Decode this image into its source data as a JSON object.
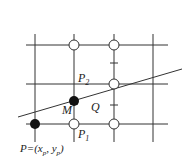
{
  "diagram": {
    "grid": {
      "vertical_x": [
        35,
        74,
        114,
        153
      ],
      "horizontal_y": [
        45,
        84,
        124
      ],
      "color": "#333333"
    },
    "line": {
      "x1": 18,
      "y1": 117,
      "x2": 182,
      "y2": 69
    },
    "points": {
      "P": {
        "label": "P=(x",
        "sub1": "p",
        "mid": ", y",
        "sub2": "p",
        "end": ")"
      },
      "P1": {
        "label": "P",
        "sub": "1"
      },
      "P2": {
        "label": "P",
        "sub": "2"
      },
      "M": {
        "label": "M"
      },
      "Q": {
        "label": "Q"
      }
    }
  }
}
